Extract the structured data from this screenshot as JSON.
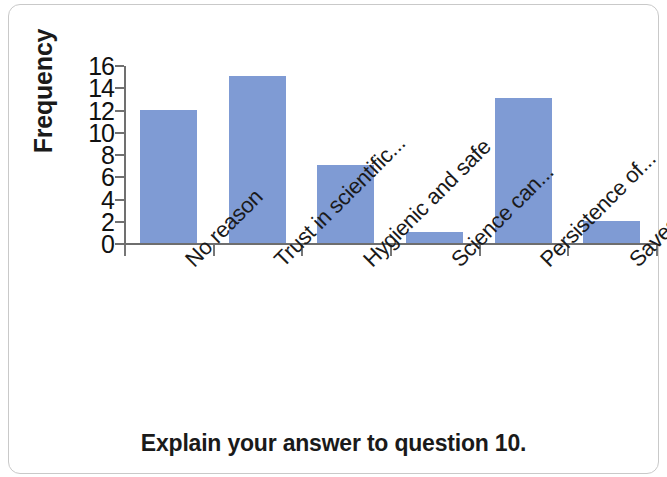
{
  "chart_data": {
    "type": "bar",
    "title": "",
    "xlabel": "Explain your answer to question 10.",
    "ylabel": "Frequency",
    "categories": [
      "No reason",
      "Trust in scientific...",
      "Hygienic and safe",
      "Science can...",
      "Persistence of...",
      "Saves water and..."
    ],
    "values": [
      12,
      15,
      7,
      1,
      13,
      2
    ],
    "ylim": [
      0,
      16
    ],
    "ytick_labels": [
      "16",
      "14",
      "12",
      "10",
      "8",
      "6",
      "4",
      "2",
      "0"
    ],
    "ytick_values": [
      16,
      14,
      12,
      10,
      8,
      6,
      4,
      2,
      0
    ],
    "ytick_step": 2,
    "grid": false,
    "legend": null,
    "legend_position": "none",
    "series": [
      {
        "name": "Frequency",
        "values": [
          12,
          15,
          7,
          1,
          13,
          2
        ]
      }
    ],
    "colors": {
      "bar": "#7f9bd4",
      "axis": "#707070",
      "text": "#1a1a1a",
      "background": "#ffffff",
      "frame": "#c9c9c9"
    },
    "category_label_rotation": "-45"
  }
}
